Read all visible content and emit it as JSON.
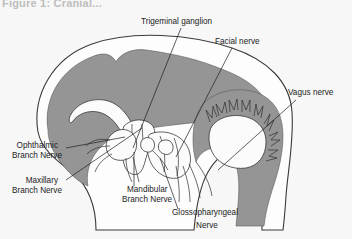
{
  "figure": {
    "caption": "Figure 1: Cranial...",
    "background_color": "#f7f7f7",
    "brain_color": "#959595",
    "outline_color": "#3a3a3a",
    "label_color": "#1c1c1c"
  },
  "labels": [
    {
      "id": "trigeminal-ganglion",
      "text": "Trigeminal ganglion",
      "x": 141,
      "y": 24,
      "anchor": "start"
    },
    {
      "id": "facial-nerve",
      "text": "Facial nerve",
      "x": 215,
      "y": 44,
      "anchor": "start"
    },
    {
      "id": "vagus-nerve",
      "text": "Vagus nerve",
      "x": 288,
      "y": 95,
      "anchor": "start"
    },
    {
      "id": "ophthalmic-branch-nerve-1",
      "text": "Ophthalmic",
      "x": 58,
      "y": 148,
      "anchor": "end"
    },
    {
      "id": "ophthalmic-branch-nerve-2",
      "text": "Branch Nerve",
      "x": 62,
      "y": 158,
      "anchor": "end"
    },
    {
      "id": "maxillary-branch-nerve-1",
      "text": "Maxillary",
      "x": 58,
      "y": 183,
      "anchor": "end"
    },
    {
      "id": "maxillary-branch-nerve-2",
      "text": "Branch Nerve",
      "x": 62,
      "y": 193,
      "anchor": "end"
    },
    {
      "id": "mandibular-branch-nerve-1",
      "text": "Mandibular",
      "x": 127,
      "y": 192,
      "anchor": "start"
    },
    {
      "id": "mandibular-branch-nerve-2",
      "text": "Branch Nerve",
      "x": 122,
      "y": 202,
      "anchor": "start"
    },
    {
      "id": "glossopharyngeal-nerve-1",
      "text": "Glossopharyngeal",
      "x": 172,
      "y": 215,
      "anchor": "start"
    },
    {
      "id": "glossopharyngeal-nerve-2",
      "text": "Nerve",
      "x": 196,
      "y": 228,
      "anchor": "start"
    }
  ],
  "leader_lines": [
    {
      "id": "leader-trigeminal-ganglion",
      "d": "M 181 28 L 133 148"
    },
    {
      "id": "leader-facial-nerve",
      "d": "M 232 48 L 176 157"
    },
    {
      "id": "leader-vagus-nerve",
      "d": "M 296 100 L 218 170"
    },
    {
      "id": "leader-ophthalmic",
      "d": "M 66 148 L 125 137"
    },
    {
      "id": "leader-maxillary",
      "d": "M 66 180 L 142 128"
    },
    {
      "id": "leader-mandibular",
      "d": "M 134 186 L 134 152"
    },
    {
      "id": "leader-glossopharyngeal",
      "d": "M 178 209 L 160 158"
    }
  ],
  "structures": [
    {
      "id": "skull-outline",
      "name": "skull-outline"
    },
    {
      "id": "cerebrum",
      "name": "cerebrum"
    },
    {
      "id": "cerebellum",
      "name": "cerebellum"
    },
    {
      "id": "lateral-ventricle",
      "name": "lateral-ventricle"
    },
    {
      "id": "brainstem",
      "name": "brainstem"
    },
    {
      "id": "nerve-bundle",
      "name": "cranial-nerve-bundle"
    }
  ]
}
